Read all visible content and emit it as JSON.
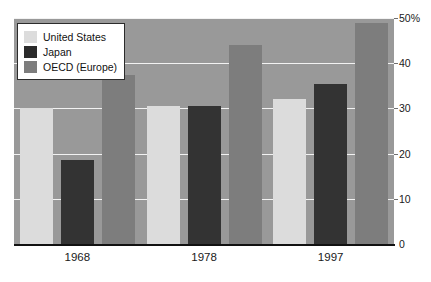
{
  "chart_data": {
    "type": "bar",
    "title": "",
    "xlabel": "",
    "ylabel": "",
    "categories": [
      "1968",
      "1978",
      "1997"
    ],
    "series": [
      {
        "name": "United States",
        "color": "#dcdcdc",
        "values": [
          30.0,
          30.5,
          32.0
        ]
      },
      {
        "name": "Japan",
        "color": "#333333",
        "values": [
          18.5,
          30.5,
          35.5
        ]
      },
      {
        "name": "OECD (Europe)",
        "color": "#7d7d7d",
        "values": [
          37.5,
          44.0,
          49.0
        ]
      }
    ],
    "ylim": [
      0,
      50
    ],
    "yticks": [
      0,
      10,
      20,
      30,
      40,
      50
    ],
    "ytick_labels": [
      "0",
      "10",
      "20",
      "30",
      "40",
      "50%"
    ],
    "grid": true,
    "grid_color": "#f2f2f2",
    "plot_background": "#999999",
    "axis_color": "#111111",
    "legend_position": "top-left"
  },
  "legend": {
    "items": [
      {
        "label": "United States",
        "swatch": "us"
      },
      {
        "label": "Japan",
        "swatch": "jp"
      },
      {
        "label": "OECD (Europe)",
        "swatch": "oecd"
      }
    ]
  },
  "axis": {
    "y_labels": [
      "50%",
      "40",
      "30",
      "20",
      "10",
      "0"
    ],
    "x_labels": [
      "1968",
      "1978",
      "1997"
    ]
  }
}
